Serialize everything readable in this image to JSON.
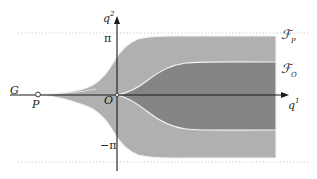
{
  "figure": {
    "type": "mathematical-diagram",
    "background_color": "#ffffff",
    "axes": {
      "horizontal": {
        "name": "q1-axis",
        "label": "q",
        "label_superscript": "1",
        "color": "#1a1a1a",
        "y_pixel": 95,
        "x_start": 10,
        "x_end": 286,
        "arrow": true
      },
      "vertical": {
        "name": "q2-axis",
        "label": "q",
        "label_superscript": "2",
        "color": "#1a1a1a",
        "x_pixel": 117,
        "y_start": 170,
        "y_end": 18,
        "arrow": true
      }
    },
    "gridlines": [
      {
        "name": "pi-line",
        "value_label": "π",
        "y_pixel": 33,
        "style": "dotted",
        "color": "#c8c8c8"
      },
      {
        "name": "minus-pi-line",
        "value_label": "−π",
        "y_pixel": 162,
        "style": "dotted",
        "color": "#c8c8c8"
      }
    ],
    "tick_labels": {
      "pi": "π",
      "minus_pi": "−π"
    },
    "points": [
      {
        "name": "origin",
        "label": "O",
        "x_pixel": 117,
        "y_pixel": 95,
        "marker": "dot"
      },
      {
        "name": "point-p",
        "label": "P",
        "x_pixel": 38,
        "y_pixel": 95,
        "marker": "open-circle"
      }
    ],
    "region_labels": [
      {
        "name": "region-fp",
        "letter": "ℱ",
        "subscript": "P",
        "x_pixel": 281,
        "y_pixel": 28
      },
      {
        "name": "region-fo",
        "letter": "ℱ",
        "subscript": "O",
        "x_pixel": 281,
        "y_pixel": 62
      }
    ],
    "curve_label_G": "G",
    "colors": {
      "outer_region": "#b0b0b0",
      "inner_region": "#858585",
      "boundary_stroke": "#f2f2f2",
      "axis": "#1a1a1a",
      "dotted_gridline": "#c8c8c8",
      "text": "#1a1a1a"
    },
    "geometry": {
      "right_edge_x": 276,
      "outer_top_asymptote_y": 36,
      "outer_bottom_asymptote_y": 158,
      "inner_top_asymptote_y": 62,
      "inner_bottom_asymptote_y": 130,
      "cusp_tip_x": 38
    }
  }
}
